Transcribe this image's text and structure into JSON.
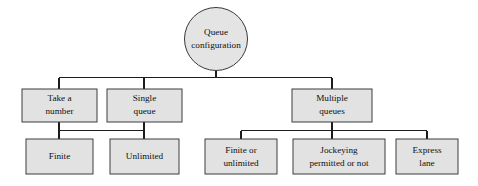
{
  "diagram": {
    "title": "Queue configuration",
    "type": "hierarchy-tree",
    "colors": {
      "node_fill": "#e2e2e2",
      "node_stroke": "#3c3c3c",
      "connector": "#1c1c1c",
      "background": "#ffffff",
      "text": "#101010"
    },
    "root": {
      "label_line1": "Queue",
      "label_line2": "configuration",
      "shape": "circle"
    },
    "level2": [
      {
        "label_line1": "Take a",
        "label_line2": "number",
        "shape": "rect"
      },
      {
        "label_line1": "Single",
        "label_line2": "queue",
        "shape": "rect"
      },
      {
        "label_line1": "Multiple",
        "label_line2": "queues",
        "shape": "rect"
      }
    ],
    "level3": [
      {
        "label_line1": "Finite",
        "label_line2": "",
        "shape": "rect"
      },
      {
        "label_line1": "Unlimited",
        "label_line2": "",
        "shape": "rect"
      },
      {
        "label_line1": "Finite or",
        "label_line2": "unlimited",
        "shape": "rect"
      },
      {
        "label_line1": "Jockeying",
        "label_line2": "permitted or not",
        "shape": "rect"
      },
      {
        "label_line1": "Express",
        "label_line2": "lane",
        "shape": "rect"
      }
    ]
  }
}
